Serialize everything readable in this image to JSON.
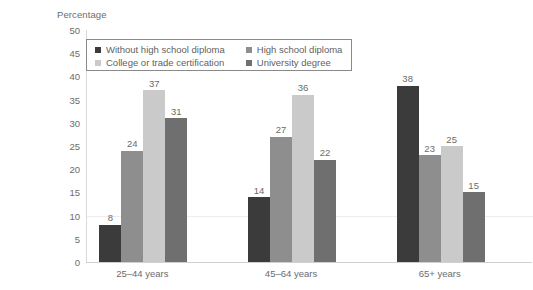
{
  "chart_data": {
    "type": "bar",
    "title": "",
    "xlabel": "",
    "ylabel": "Percentage",
    "ylim": [
      0,
      50
    ],
    "ytick_step": 5,
    "yticks": [
      50,
      45,
      40,
      35,
      30,
      25,
      20,
      15,
      10,
      5,
      0
    ],
    "grid": true,
    "gridlines": [
      10
    ],
    "legend_position": "top-left-inside-box",
    "categories": [
      "25–44 years",
      "45–64 years",
      "65+ years"
    ],
    "series": [
      {
        "name": "Without high school diploma",
        "color": "#3b3b3b",
        "values": [
          8,
          14,
          38
        ]
      },
      {
        "name": "High school diploma",
        "color": "#8e8e8e",
        "values": [
          24,
          27,
          23
        ]
      },
      {
        "name": "College or trade certification",
        "color": "#cacaca",
        "values": [
          37,
          36,
          25
        ]
      },
      {
        "name": "University degree",
        "color": "#6f6f6f",
        "values": [
          31,
          22,
          15
        ]
      }
    ],
    "legend_order": [
      "Without high school diploma",
      "High school diploma",
      "College or trade certification",
      "University degree"
    ]
  },
  "style": {
    "axis_color": "#d0d0d0",
    "grid_color": "#f0ecec",
    "text_color": "#6b6b6b",
    "legend_border": "#8a8a8a",
    "background": "#ffffff"
  }
}
